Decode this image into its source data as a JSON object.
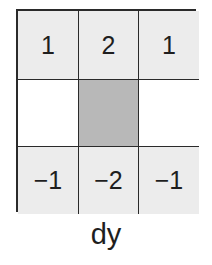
{
  "kernel": {
    "name": "dy",
    "colors": {
      "light": "#ececec",
      "white": "#ffffff",
      "center": "#b8b8b8",
      "border": "#2a2a2a"
    },
    "rows": [
      [
        {
          "value": "1",
          "fill": "light"
        },
        {
          "value": "2",
          "fill": "light"
        },
        {
          "value": "1",
          "fill": "light"
        }
      ],
      [
        {
          "value": "",
          "fill": "white"
        },
        {
          "value": "",
          "fill": "center"
        },
        {
          "value": "",
          "fill": "white"
        }
      ],
      [
        {
          "value": "−1",
          "fill": "light"
        },
        {
          "value": "−2",
          "fill": "light"
        },
        {
          "value": "−1",
          "fill": "light"
        }
      ]
    ]
  },
  "caption": "dy"
}
